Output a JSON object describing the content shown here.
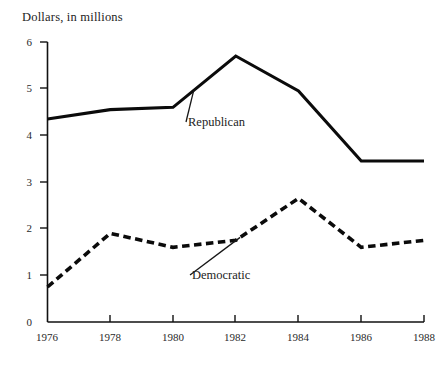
{
  "chart_data": {
    "type": "line",
    "title": "Dollars, in millions",
    "xlabel": "",
    "ylabel": "Dollars, in millions",
    "x": [
      1976,
      1978,
      1980,
      1982,
      1984,
      1986,
      1988
    ],
    "xtick_labels": [
      "1976",
      "1978",
      "1980",
      "1982",
      "1984",
      "1986",
      "1988"
    ],
    "ytick_labels": [
      "0",
      "1",
      "2",
      "3",
      "4",
      "5",
      "6"
    ],
    "ytick_values": [
      0,
      1,
      2,
      3,
      4,
      5,
      6
    ],
    "xlim": [
      1976,
      1988
    ],
    "ylim": [
      0,
      6
    ],
    "grid": false,
    "legend_position": "inline-annotation",
    "series": [
      {
        "name": "Republican",
        "style": "solid",
        "color": "#0b0b0b",
        "values": [
          4.35,
          4.55,
          4.6,
          5.7,
          4.95,
          3.45,
          3.45
        ]
      },
      {
        "name": "Democratic",
        "style": "dashed",
        "color": "#0b0b0b",
        "values": [
          0.75,
          1.9,
          1.6,
          1.75,
          2.65,
          1.6,
          1.75
        ]
      }
    ],
    "annotations": [
      {
        "text": "Republican",
        "series": "Republican"
      },
      {
        "text": "Democratic",
        "series": "Democratic"
      }
    ]
  }
}
